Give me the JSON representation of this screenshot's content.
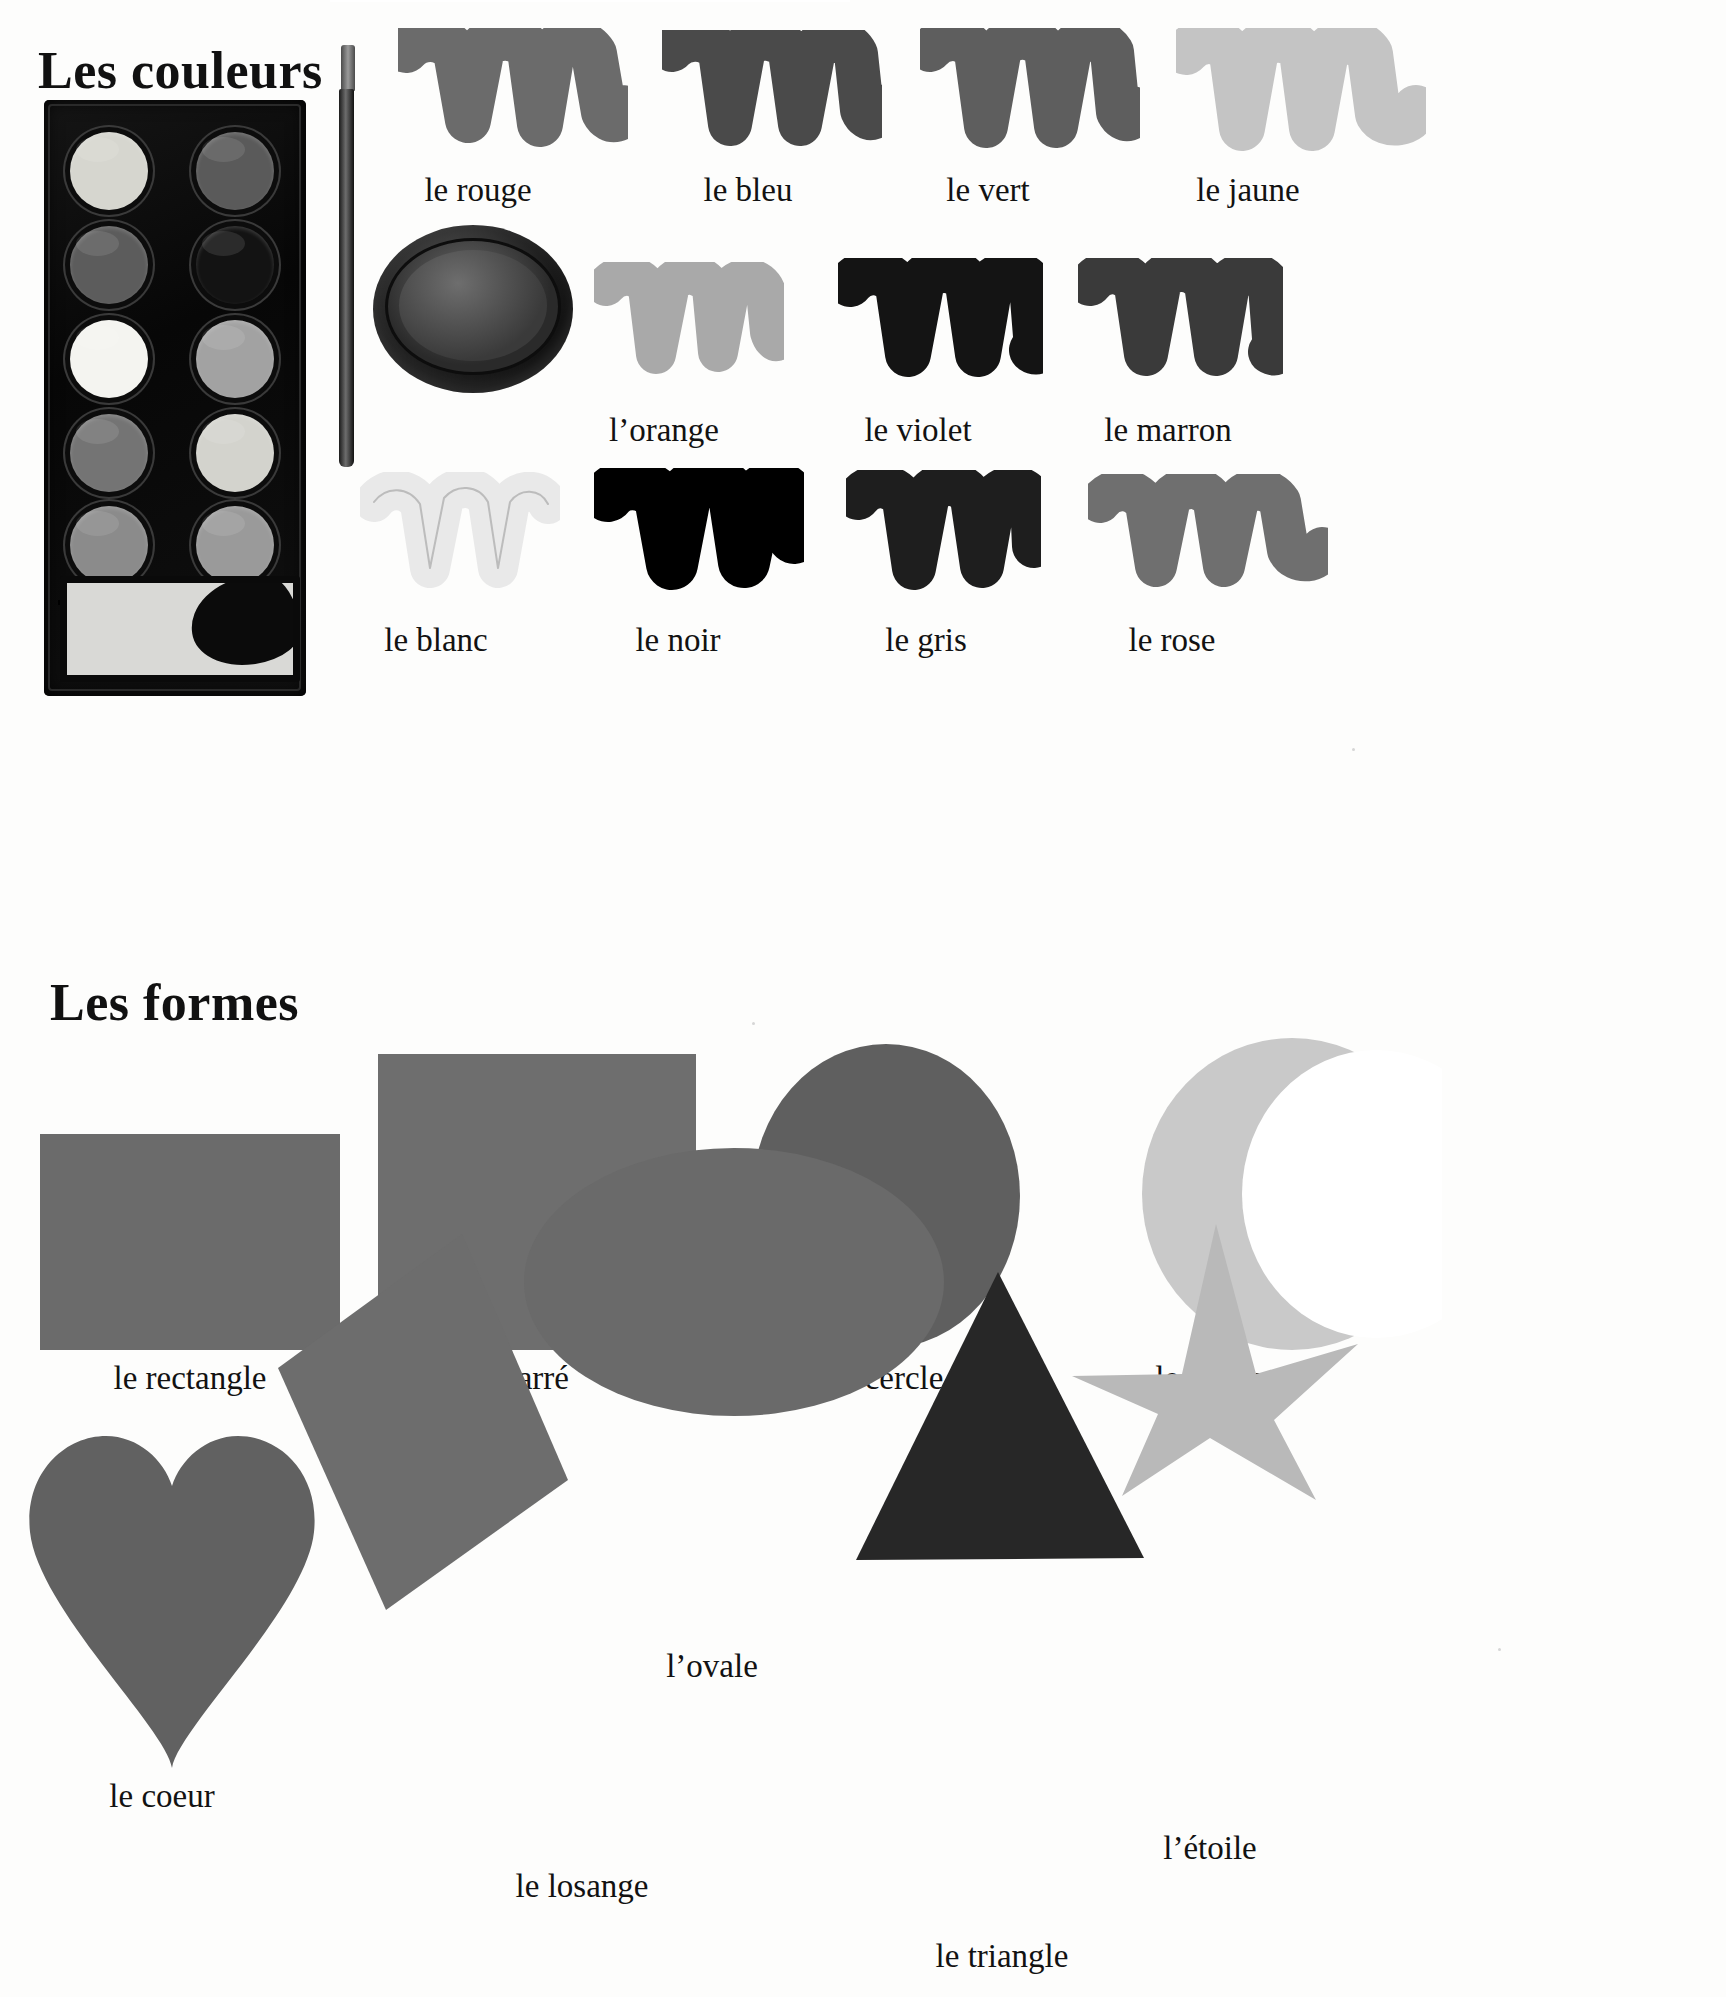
{
  "page": {
    "language": "French"
  },
  "sections": [
    {
      "id": "colors",
      "heading": "Les couleurs",
      "items": [
        {
          "label": "le rouge",
          "swatch": "scribble",
          "tone": "#6b6b6b"
        },
        {
          "label": "le bleu",
          "swatch": "scribble",
          "tone": "#4a4a4a"
        },
        {
          "label": "le vert",
          "swatch": "scribble",
          "tone": "#5e5e5e"
        },
        {
          "label": "le jaune",
          "swatch": "scribble",
          "tone": "#c2c2c2"
        },
        {
          "label": "l’orange",
          "swatch": "scribble",
          "tone": "#a9a9a9"
        },
        {
          "label": "le violet",
          "swatch": "scribble",
          "tone": "#141414"
        },
        {
          "label": "le marron",
          "swatch": "scribble",
          "tone": "#3a3a3a"
        },
        {
          "label": "le blanc",
          "swatch": "scribble",
          "tone": "#e8e8e8"
        },
        {
          "label": "le noir",
          "swatch": "scribble",
          "tone": "#000000"
        },
        {
          "label": "le gris",
          "swatch": "scribble",
          "tone": "#1e1e1e"
        },
        {
          "label": "le rose",
          "swatch": "scribble",
          "tone": "#6f6f6f"
        }
      ],
      "props": {
        "palette": "watercolor-paint-palette",
        "brush": "paintbrush",
        "pot": "paint-pot-lid"
      }
    },
    {
      "id": "shapes",
      "heading": "Les formes",
      "items": [
        {
          "label": "le rectangle",
          "shape": "rectangle",
          "tone": "#6b6b6b"
        },
        {
          "label": "le carré",
          "shape": "square",
          "tone": "#6e6e6e"
        },
        {
          "label": "le cercle",
          "shape": "circle",
          "tone": "#5f5f5f"
        },
        {
          "label": "le croissant",
          "shape": "crescent",
          "tone": "#c9c9c9"
        },
        {
          "label": "le coeur",
          "shape": "heart",
          "tone": "#616161"
        },
        {
          "label": "le losange",
          "shape": "diamond",
          "tone": "#6d6d6d"
        },
        {
          "label": "l’ovale",
          "shape": "oval",
          "tone": "#6a6a6a"
        },
        {
          "label": "le triangle",
          "shape": "triangle",
          "tone": "#272727"
        },
        {
          "label": "l’étoile",
          "shape": "star",
          "tone": "#b9b9b9"
        }
      ]
    }
  ],
  "colors": {
    "ink": "#121212",
    "paper": "#fdfdfc",
    "palette_case": "#0a0a0a",
    "mix_tray": "#d9d9d6"
  }
}
